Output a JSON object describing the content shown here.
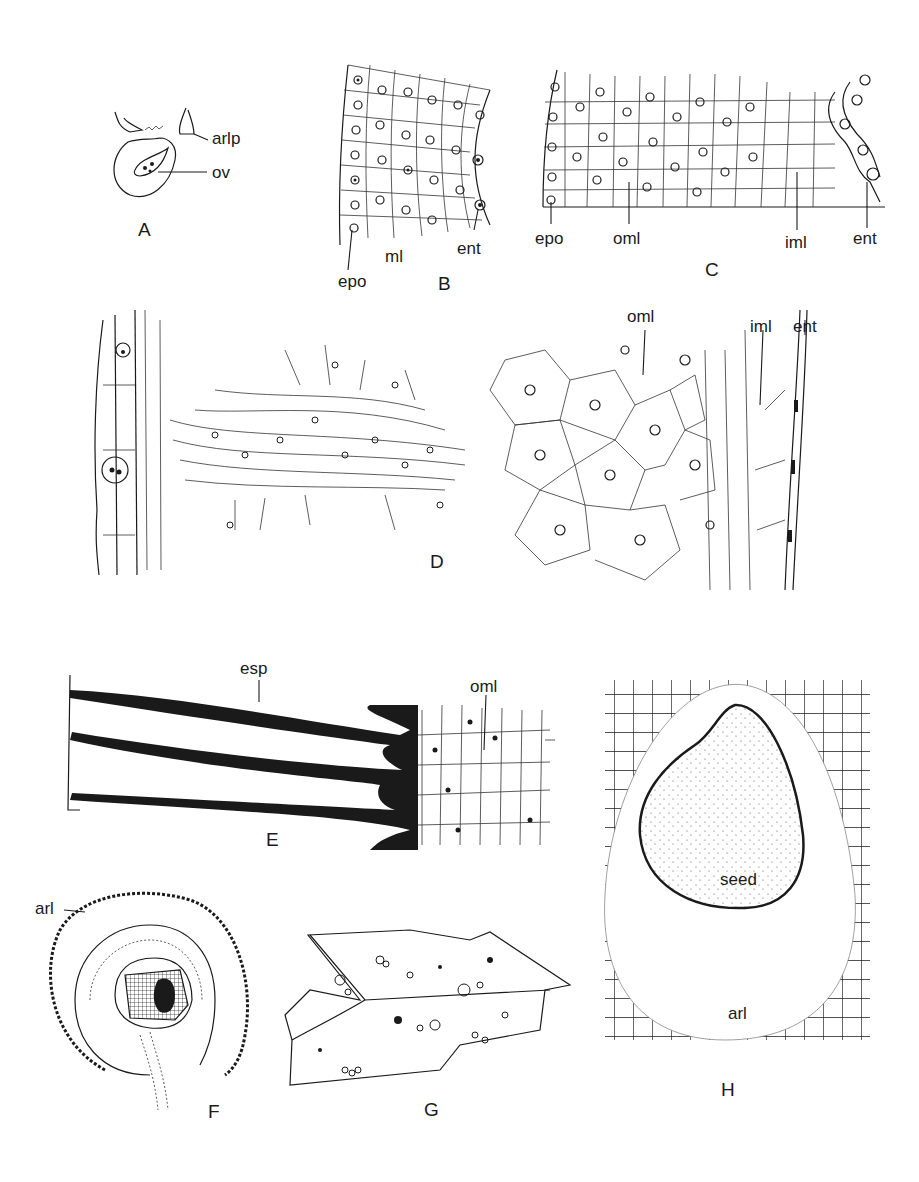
{
  "figure": {
    "panels": [
      {
        "id": "A",
        "letter": "A",
        "labels": [
          "arlp",
          "ov"
        ]
      },
      {
        "id": "B",
        "letter": "B",
        "labels": [
          "epo",
          "ml",
          "ent"
        ]
      },
      {
        "id": "C",
        "letter": "C",
        "labels": [
          "epo",
          "oml",
          "iml",
          "ent"
        ]
      },
      {
        "id": "D",
        "letter": "D",
        "labels": [
          "oml",
          "iml",
          "ent"
        ]
      },
      {
        "id": "E",
        "letter": "E",
        "labels": [
          "esp",
          "oml"
        ]
      },
      {
        "id": "F",
        "letter": "F",
        "labels": [
          "arl"
        ]
      },
      {
        "id": "G",
        "letter": "G",
        "labels": []
      },
      {
        "id": "H",
        "letter": "H",
        "labels": [
          "seed",
          "arl"
        ]
      }
    ]
  },
  "colors": {
    "ink": "#1a1a1a",
    "paper": "#ffffff",
    "stipple": "#555555"
  }
}
